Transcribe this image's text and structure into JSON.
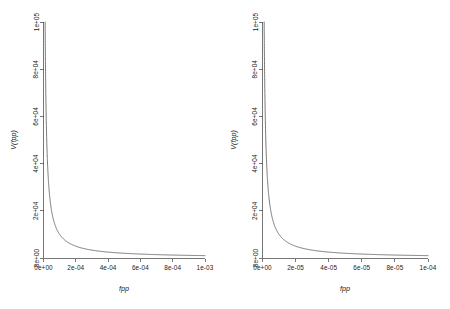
{
  "figure": {
    "background_color": "#ffffff",
    "axis_color": "#4a4a4a",
    "curve_color": "#555555",
    "panel_count": 2
  },
  "chart_data": [
    {
      "type": "line",
      "panel": "left",
      "title": "",
      "xlabel": "fpp",
      "ylabel": "V(fpp)",
      "xlim": [
        0,
        0.001
      ],
      "ylim": [
        0,
        100000
      ],
      "xticks": [
        0,
        0.0002,
        0.0004,
        0.0006,
        0.0008,
        0.001
      ],
      "xticklabels": [
        "0e+00",
        "2e-04",
        "4e-04",
        "6e-04",
        "8e-04",
        "1e-03"
      ],
      "yticks": [
        0,
        20000,
        40000,
        60000,
        80000,
        100000
      ],
      "yticklabels": [
        "0e+00",
        "2e+04",
        "4e+04",
        "6e+04",
        "8e+04",
        "1e+05"
      ],
      "grid": false,
      "legend": "none",
      "series": [
        {
          "name": "V(fpp)",
          "x": [
            1e-05,
            1.2e-05,
            1.5e-05,
            1.8e-05,
            2.2e-05,
            2.6e-05,
            3e-05,
            3.6e-05,
            4.2e-05,
            5e-05,
            6e-05,
            7e-05,
            8e-05,
            9e-05,
            0.0001,
            0.00012,
            0.00014,
            0.00016,
            0.00018,
            0.0002,
            0.00025,
            0.0003,
            0.00035,
            0.0004,
            0.00045,
            0.0005,
            0.00055,
            0.0006,
            0.00065,
            0.0007,
            0.00075,
            0.0008,
            0.00085,
            0.0009,
            0.00095,
            0.001
          ],
          "y": [
            100000,
            83333,
            66667,
            55556,
            45455,
            38462,
            33333,
            27778,
            23810,
            20000,
            16667,
            14286,
            12500,
            11111,
            10000,
            8333,
            7143,
            6250,
            5556,
            5000,
            4000,
            3333,
            2857,
            2500,
            2222,
            2000,
            1818,
            1667,
            1538,
            1429,
            1333,
            1250,
            1176,
            1111,
            1053,
            1000
          ]
        }
      ]
    },
    {
      "type": "line",
      "panel": "right",
      "title": "",
      "xlabel": "fpp",
      "ylabel": "V(fpp)",
      "xlim": [
        0,
        0.0001
      ],
      "ylim": [
        0,
        100000
      ],
      "xticks": [
        0,
        2e-05,
        4e-05,
        6e-05,
        8e-05,
        0.0001
      ],
      "xticklabels": [
        "0e+00",
        "2e-05",
        "4e-05",
        "6e-05",
        "8e-05",
        "1e-04"
      ],
      "yticks": [
        0,
        20000,
        40000,
        60000,
        80000,
        100000
      ],
      "yticklabels": [
        "0e+00",
        "2e+04",
        "4e+04",
        "6e+04",
        "8e+04",
        "1e+05"
      ],
      "grid": false,
      "legend": "none",
      "series": [
        {
          "name": "V(fpp)",
          "x": [
            1e-06,
            1.2e-06,
            1.5e-06,
            2e-06,
            2.5e-06,
            3e-06,
            3.5e-06,
            4e-06,
            5e-06,
            6e-06,
            7e-06,
            8e-06,
            9e-06,
            1e-05,
            1.2e-05,
            1.4e-05,
            1.6e-05,
            1.8e-05,
            2e-05,
            2.5e-05,
            3e-05,
            3.5e-05,
            4e-05,
            4.5e-05,
            5e-05,
            5.5e-05,
            6e-05,
            6.5e-05,
            7e-05,
            7.5e-05,
            8e-05,
            8.5e-05,
            9e-05,
            9.5e-05,
            0.0001
          ],
          "y": [
            100000,
            83333,
            66667,
            50000,
            40000,
            33333,
            28571,
            25000,
            20000,
            16667,
            14286,
            12500,
            11111,
            10000,
            8333,
            7143,
            6250,
            5556,
            5000,
            4000,
            3333,
            2857,
            2500,
            2222,
            2000,
            1818,
            1667,
            1538,
            1429,
            1333,
            1250,
            1176,
            1111,
            1053,
            1000
          ]
        }
      ]
    }
  ],
  "left_panel": {
    "ylabel": "V(fpp)",
    "xlabel": "fpp",
    "xticklabels": [
      "0e+00",
      "2e-04",
      "4e-04",
      "6e-04",
      "8e-04",
      "1e-03"
    ],
    "yticklabels": [
      "0e+00",
      "2e+04",
      "4e+04",
      "6e+04",
      "8e+04",
      "1e+05"
    ]
  },
  "right_panel": {
    "ylabel": "V(fpp)",
    "xlabel": "fpp",
    "xticklabels": [
      "0e+00",
      "2e-05",
      "4e-05",
      "6e-05",
      "8e-05",
      "1e-04"
    ],
    "yticklabels": [
      "0e+00",
      "2e+04",
      "4e+04",
      "6e+04",
      "8e+04",
      "1e+05"
    ]
  }
}
